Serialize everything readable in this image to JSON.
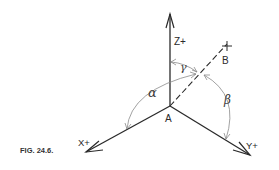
{
  "figure": {
    "caption": "FIG. 24.6.",
    "origin_label": "A",
    "point_label": "B",
    "axes": {
      "z": {
        "label": "Z+"
      },
      "x": {
        "label": "X+"
      },
      "y": {
        "label": "Y+"
      }
    },
    "angles": {
      "alpha": "α",
      "beta": "β",
      "gamma": "γ"
    },
    "colors": {
      "line": "#2a2a2a",
      "arc": "#8a8a8a",
      "background": "#ffffff"
    }
  }
}
